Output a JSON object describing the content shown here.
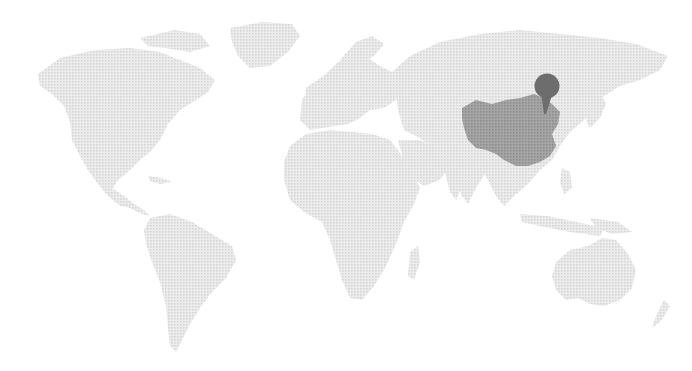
{
  "map": {
    "type": "world-map",
    "background_color": "#ffffff",
    "land_color": "#e2e2e2",
    "highlight": {
      "country": "China",
      "color": "#9a9a9a"
    },
    "marker": {
      "type": "pin",
      "location": "Beijing",
      "color": "#6d6d6d",
      "position_px": {
        "x": 547,
        "y": 87
      }
    },
    "continents": [
      "North America",
      "South America",
      "Europe",
      "Africa",
      "Asia",
      "Australia",
      "Greenland"
    ]
  }
}
